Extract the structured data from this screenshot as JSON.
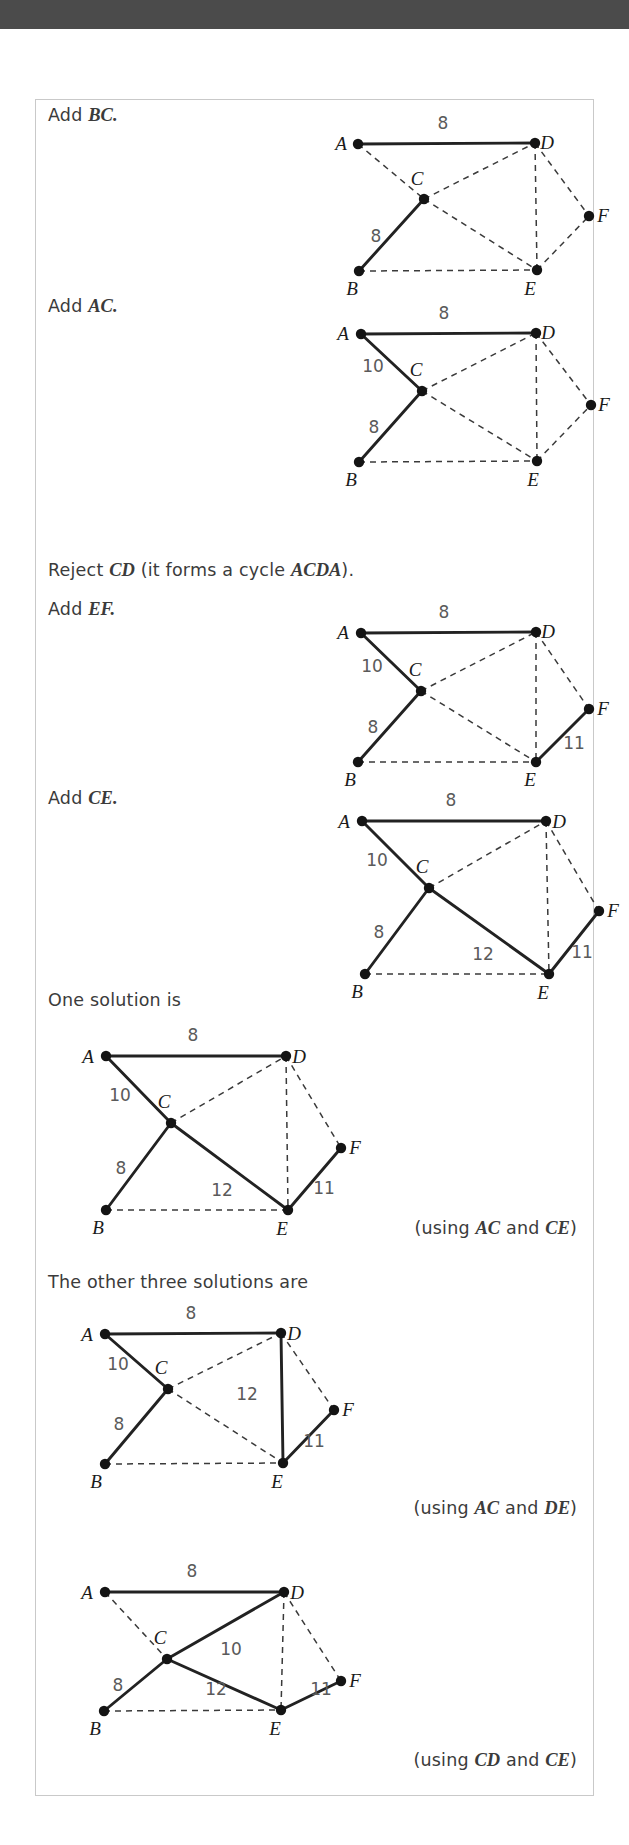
{
  "document": {
    "topbar_color": "#4b4b4b",
    "page_border_color": "#c9c9c9",
    "edge_solid_color": "#222222",
    "edge_dash_color": "#3a3a3a",
    "node_color": "#141414",
    "text_color": "#3b3b3b"
  },
  "steps": [
    {
      "id": "step-add-bc",
      "caption_plain": "Add ",
      "caption_italic": "BC.",
      "graph": "graph-1"
    },
    {
      "id": "step-add-ac",
      "caption_plain": "Add ",
      "caption_italic": "AC.",
      "graph": "graph-2"
    },
    {
      "id": "step-reject-cd",
      "caption_parts": [
        "Reject ",
        "CD",
        " (it forms a cycle ",
        "ACDA",
        ")."
      ],
      "caption2_plain": "Add ",
      "caption2_italic": "EF.",
      "graph": "graph-3"
    },
    {
      "id": "step-add-ce",
      "caption_plain": "Add ",
      "caption_italic": "CE.",
      "graph": "graph-4"
    },
    {
      "id": "step-one-solution",
      "caption_plain": "One solution is",
      "caption_italic": "",
      "graph": "graph-5",
      "note_parts": [
        "(using ",
        "AC",
        " and ",
        "CE",
        ")"
      ]
    },
    {
      "id": "step-other-solutions",
      "caption_plain": "The other three solutions are",
      "caption_italic": "",
      "graph": "graph-6",
      "note_parts": [
        "(using ",
        "AC",
        " and ",
        "DE",
        ")"
      ]
    },
    {
      "id": "step-last-solution",
      "graph": "graph-7",
      "note_parts": [
        "(using ",
        "CD",
        " and ",
        "CE",
        ")"
      ]
    }
  ],
  "chart_data": {
    "type": "diagram",
    "vertices": [
      "A",
      "B",
      "C",
      "D",
      "E",
      "F"
    ],
    "edge_weights": {
      "AD": 8,
      "AC": 10,
      "BC": 8,
      "CD": 10,
      "CE": 12,
      "DE": 12,
      "DF": 14,
      "EF": 11,
      "BE": 16
    },
    "graphs": [
      {
        "id": "graph-1",
        "width": 310,
        "height": 160,
        "offset_x": 250,
        "offset_y": 5,
        "nodes": {
          "A": [
            72,
            39
          ],
          "B": [
            73,
            166
          ],
          "C": [
            138,
            94
          ],
          "D": [
            249,
            38
          ],
          "E": [
            251,
            165
          ],
          "F": [
            303,
            111
          ]
        },
        "label_pos": {
          "A": [
            55,
            45
          ],
          "B": [
            66,
            190
          ],
          "C": [
            131,
            80
          ],
          "D": [
            261,
            44
          ],
          "E": [
            244,
            190
          ],
          "F": [
            317,
            117
          ]
        },
        "solid": [
          "AD",
          "BC"
        ],
        "dashed": [
          "AC",
          "CD",
          "CE",
          "DE",
          "DF",
          "EF",
          "BE"
        ],
        "weights": [
          {
            "edge": "AD",
            "value": "8",
            "x": 157,
            "y": 24
          },
          {
            "edge": "BC",
            "value": "8",
            "x": 90,
            "y": 137
          }
        ]
      },
      {
        "id": "graph-2",
        "width": 310,
        "height": 160,
        "offset_x": 250,
        "offset_y": 196,
        "nodes": {
          "A": [
            75,
            38
          ],
          "B": [
            73,
            166
          ],
          "C": [
            136,
            95
          ],
          "D": [
            250,
            37
          ],
          "E": [
            251,
            165
          ],
          "F": [
            305,
            109
          ]
        },
        "label_pos": {
          "A": [
            57,
            44
          ],
          "B": [
            65,
            190
          ],
          "C": [
            130,
            80
          ],
          "D": [
            262,
            43
          ],
          "E": [
            247,
            190
          ],
          "F": [
            318,
            115
          ]
        },
        "solid": [
          "AD",
          "AC",
          "BC"
        ],
        "dashed": [
          "CD",
          "CE",
          "DE",
          "DF",
          "EF",
          "BE"
        ],
        "weights": [
          {
            "edge": "AD",
            "value": "8",
            "x": 158,
            "y": 23
          },
          {
            "edge": "AC",
            "value": "10",
            "x": 87,
            "y": 76
          },
          {
            "edge": "BC",
            "value": "8",
            "x": 88,
            "y": 137
          }
        ]
      },
      {
        "id": "graph-3",
        "width": 310,
        "height": 160,
        "offset_x": 250,
        "offset_y": 499,
        "nodes": {
          "A": [
            75,
            34
          ],
          "B": [
            72,
            163
          ],
          "C": [
            135,
            92
          ],
          "D": [
            250,
            33
          ],
          "E": [
            250,
            163
          ],
          "F": [
            303,
            110
          ]
        },
        "label_pos": {
          "A": [
            57,
            40
          ],
          "B": [
            64,
            187
          ],
          "C": [
            129,
            77
          ],
          "D": [
            262,
            39
          ],
          "E": [
            244,
            187
          ],
          "F": [
            317,
            116
          ]
        },
        "solid": [
          "AD",
          "AC",
          "BC",
          "EF"
        ],
        "dashed": [
          "CD",
          "CE",
          "DE",
          "DF",
          "BE"
        ],
        "weights": [
          {
            "edge": "AD",
            "value": "8",
            "x": 158,
            "y": 19
          },
          {
            "edge": "AC",
            "value": "10",
            "x": 86,
            "y": 73
          },
          {
            "edge": "BC",
            "value": "8",
            "x": 87,
            "y": 134
          },
          {
            "edge": "EF",
            "value": "11",
            "x": 288,
            "y": 150
          }
        ]
      },
      {
        "id": "graph-4",
        "width": 310,
        "height": 165,
        "offset_x": 255,
        "offset_y": 688,
        "nodes": {
          "A": [
            71,
            33
          ],
          "B": [
            74,
            186
          ],
          "C": [
            138,
            100
          ],
          "D": [
            255,
            33
          ],
          "E": [
            258,
            186
          ],
          "F": [
            308,
            123
          ]
        },
        "label_pos": {
          "A": [
            53,
            40
          ],
          "B": [
            66,
            210
          ],
          "C": [
            131,
            85
          ],
          "D": [
            268,
            40
          ],
          "E": [
            252,
            211
          ],
          "F": [
            322,
            129
          ]
        },
        "solid": [
          "AD",
          "AC",
          "BC",
          "CE",
          "EF"
        ],
        "dashed": [
          "CD",
          "DE",
          "DF",
          "BE"
        ],
        "weights": [
          {
            "edge": "AD",
            "value": "8",
            "x": 160,
            "y": 18
          },
          {
            "edge": "AC",
            "value": "10",
            "x": 86,
            "y": 78
          },
          {
            "edge": "BC",
            "value": "8",
            "x": 88,
            "y": 150
          },
          {
            "edge": "CE",
            "value": "12",
            "x": 192,
            "y": 172
          },
          {
            "edge": "EF",
            "value": "11",
            "x": 291,
            "y": 170
          }
        ]
      },
      {
        "id": "graph-5",
        "width": 310,
        "height": 165,
        "offset_x": 0,
        "offset_y": 922,
        "nodes": {
          "A": [
            70,
            34
          ],
          "B": [
            70,
            188
          ],
          "C": [
            135,
            101
          ],
          "D": [
            250,
            34
          ],
          "E": [
            252,
            188
          ],
          "F": [
            305,
            126
          ]
        },
        "label_pos": {
          "A": [
            52,
            41
          ],
          "B": [
            62,
            212
          ],
          "C": [
            128,
            86
          ],
          "D": [
            263,
            41
          ],
          "E": [
            246,
            213
          ],
          "F": [
            319,
            132
          ]
        },
        "solid": [
          "AD",
          "AC",
          "BC",
          "CE",
          "EF"
        ],
        "dashed": [
          "CD",
          "DE",
          "DF",
          "BE"
        ],
        "weights": [
          {
            "edge": "AD",
            "value": "8",
            "x": 157,
            "y": 19
          },
          {
            "edge": "AC",
            "value": "10",
            "x": 84,
            "y": 79
          },
          {
            "edge": "BC",
            "value": "8",
            "x": 85,
            "y": 152
          },
          {
            "edge": "CE",
            "value": "12",
            "x": 186,
            "y": 174
          },
          {
            "edge": "EF",
            "value": "11",
            "x": 288,
            "y": 172
          }
        ]
      },
      {
        "id": "graph-6",
        "width": 310,
        "height": 165,
        "offset_x": 0,
        "offset_y": 1200,
        "nodes": {
          "A": [
            69,
            34
          ],
          "B": [
            69,
            164
          ],
          "C": [
            132,
            89
          ],
          "D": [
            245,
            33
          ],
          "E": [
            247,
            163
          ],
          "F": [
            298,
            110
          ]
        },
        "label_pos": {
          "A": [
            51,
            41
          ],
          "B": [
            60,
            188
          ],
          "C": [
            125,
            74
          ],
          "D": [
            258,
            40
          ],
          "E": [
            241,
            188
          ],
          "F": [
            312,
            116
          ]
        },
        "solid": [
          "AD",
          "AC",
          "BC",
          "DE",
          "EF"
        ],
        "dashed": [
          "CD",
          "CE",
          "DF",
          "BE"
        ],
        "weights": [
          {
            "edge": "AD",
            "value": "8",
            "x": 155,
            "y": 19
          },
          {
            "edge": "AC",
            "value": "10",
            "x": 82,
            "y": 70
          },
          {
            "edge": "BC",
            "value": "8",
            "x": 83,
            "y": 130
          },
          {
            "edge": "DE",
            "value": "12",
            "x": 211,
            "y": 100
          },
          {
            "edge": "EF",
            "value": "11",
            "x": 278,
            "y": 147
          }
        ]
      },
      {
        "id": "graph-7",
        "width": 310,
        "height": 165,
        "offset_x": 0,
        "offset_y": 1458,
        "nodes": {
          "A": [
            69,
            34
          ],
          "B": [
            68,
            153
          ],
          "C": [
            131,
            101
          ],
          "D": [
            248,
            34
          ],
          "E": [
            245,
            152
          ],
          "F": [
            305,
            123
          ]
        },
        "label_pos": {
          "A": [
            51,
            41
          ],
          "B": [
            59,
            177
          ],
          "C": [
            124,
            86
          ],
          "D": [
            261,
            41
          ],
          "E": [
            239,
            177
          ],
          "F": [
            319,
            129
          ]
        },
        "solid": [
          "AD",
          "CD",
          "BC",
          "CE",
          "EF"
        ],
        "dashed": [
          "AC",
          "DE",
          "DF",
          "BE"
        ],
        "weights": [
          {
            "edge": "CD",
            "value": "10",
            "x": 195,
            "y": 97
          },
          {
            "edge": "AD",
            "value": "8",
            "x": 156,
            "y": 19
          },
          {
            "edge": "BC",
            "value": "8",
            "x": 82,
            "y": 133
          },
          {
            "edge": "CE",
            "value": "12",
            "x": 180,
            "y": 137
          },
          {
            "edge": "EF",
            "value": "11",
            "x": 285,
            "y": 137
          }
        ]
      }
    ]
  },
  "captions": [
    {
      "id": "cap-1",
      "x": 12,
      "y": 5,
      "plain": "Add ",
      "italic": "BC."
    },
    {
      "id": "cap-2",
      "x": 12,
      "y": 196,
      "plain": "Add ",
      "italic": "AC."
    },
    {
      "id": "cap-3a",
      "x": 12,
      "y": 460,
      "plain": "Reject ",
      "italic": "CD",
      "tail": " (it forms a cycle ",
      "italic2": "ACDA",
      "tail2": ")."
    },
    {
      "id": "cap-3b",
      "x": 12,
      "y": 499,
      "plain": "Add ",
      "italic": "EF."
    },
    {
      "id": "cap-4",
      "x": 12,
      "y": 688,
      "plain": "Add ",
      "italic": "CE."
    },
    {
      "id": "cap-5",
      "x": 12,
      "y": 890,
      "plain": "One solution is",
      "italic": ""
    },
    {
      "id": "cap-6",
      "x": 12,
      "y": 1172,
      "plain": "The other three solutions are",
      "italic": ""
    }
  ],
  "notes": [
    {
      "id": "note-1",
      "y": 1118,
      "pre": "(using ",
      "e1": "AC",
      "mid": " and ",
      "e2": "CE",
      "post": ")"
    },
    {
      "id": "note-2",
      "y": 1398,
      "pre": "(using ",
      "e1": "AC",
      "mid": " and ",
      "e2": "DE",
      "post": ")"
    },
    {
      "id": "note-3",
      "y": 1650,
      "pre": "(using ",
      "e1": "CD",
      "mid": " and ",
      "e2": "CE",
      "post": ")"
    }
  ]
}
